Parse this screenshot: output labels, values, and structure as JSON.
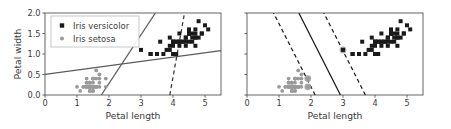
{
  "figure": {
    "background_color": "#ffffff",
    "panels": [
      {
        "id": "left",
        "name": "bad-models-panel",
        "xlabel": "Petal length",
        "ylabel": "Petal width",
        "xticks": [
          "0",
          "1",
          "2",
          "3",
          "4",
          "5"
        ],
        "xtick_values": [
          0,
          1,
          2,
          3,
          4,
          5
        ],
        "yticks": [
          "0.0",
          "0.5",
          "1.0",
          "1.5",
          "2.0"
        ],
        "ytick_values": [
          0.0,
          0.5,
          1.0,
          1.5,
          2.0
        ],
        "show_ytick_labels": true,
        "xlim": [
          0,
          5.5
        ],
        "ylim": [
          0,
          2.0
        ],
        "grid": false,
        "legend": {
          "position": "upper left",
          "entries": [
            {
              "label": "Iris versicolor",
              "marker": "square",
              "color": "#1a1a1a"
            },
            {
              "label": "Iris setosa",
              "marker": "dot",
              "color": "#9a9a9a"
            }
          ]
        },
        "lines": [
          {
            "name": "shallow-solid-boundary",
            "style": "solid",
            "color": "#5a5a5a",
            "p1": [
              0.0,
              0.5
            ],
            "p2": [
              5.5,
              1.08
            ]
          },
          {
            "name": "steep-solid-boundary",
            "style": "solid",
            "color": "#5a5a5a",
            "p1": [
              1.76,
              0.0
            ],
            "p2": [
              3.45,
              2.0
            ]
          },
          {
            "name": "steep-dashed-boundary",
            "style": "dashed",
            "color": "#3a3a3a",
            "p1": [
              3.9,
              0.0
            ],
            "p2": [
              4.36,
              2.0
            ]
          }
        ]
      },
      {
        "id": "right",
        "name": "large-margin-panel",
        "xlabel": "Petal length",
        "ylabel": "",
        "xticks": [
          "0",
          "1",
          "2",
          "3",
          "4",
          "5"
        ],
        "xtick_values": [
          0,
          1,
          2,
          3,
          4,
          5
        ],
        "yticks": [
          "",
          "",
          "",
          "",
          ""
        ],
        "ytick_values": [
          0.0,
          0.5,
          1.0,
          1.5,
          2.0
        ],
        "show_ytick_labels": false,
        "xlim": [
          0,
          5.5
        ],
        "ylim": [
          0,
          2.0
        ],
        "grid": false,
        "legend": null,
        "lines": [
          {
            "name": "svm-decision-boundary",
            "style": "solid",
            "color": "#1a1a1a",
            "p1": [
              2.92,
              0.0
            ],
            "p2": [
              1.62,
              2.0
            ]
          },
          {
            "name": "svm-margin-lower",
            "style": "dashed",
            "color": "#1a1a1a",
            "p1": [
              3.7,
              0.0
            ],
            "p2": [
              2.4,
              2.0
            ]
          },
          {
            "name": "svm-margin-upper",
            "style": "dashed",
            "color": "#1a1a1a",
            "p1": [
              2.13,
              0.0
            ],
            "p2": [
              0.83,
              2.0
            ]
          }
        ],
        "support_vectors": [
          {
            "x": 3.0,
            "y": 1.1,
            "class": "Iris versicolor"
          },
          {
            "x": 1.9,
            "y": 0.4,
            "class": "Iris setosa"
          },
          {
            "x": 1.9,
            "y": 0.2,
            "class": "Iris setosa"
          }
        ]
      }
    ]
  },
  "chart_data": {
    "type": "scatter",
    "title": "",
    "xlabel": "Petal length",
    "ylabel": "Petal width",
    "xlim": [
      0,
      5.5
    ],
    "ylim": [
      0,
      2.0
    ],
    "grid": false,
    "legend_position": "upper left",
    "series": [
      {
        "name": "Iris setosa",
        "marker": "dot",
        "color": "#9a9a9a",
        "points": [
          [
            1.4,
            0.2
          ],
          [
            1.4,
            0.2
          ],
          [
            1.3,
            0.2
          ],
          [
            1.5,
            0.2
          ],
          [
            1.4,
            0.2
          ],
          [
            1.7,
            0.4
          ],
          [
            1.4,
            0.3
          ],
          [
            1.5,
            0.2
          ],
          [
            1.4,
            0.2
          ],
          [
            1.5,
            0.1
          ],
          [
            1.5,
            0.2
          ],
          [
            1.6,
            0.2
          ],
          [
            1.4,
            0.1
          ],
          [
            1.1,
            0.1
          ],
          [
            1.2,
            0.2
          ],
          [
            1.5,
            0.4
          ],
          [
            1.3,
            0.4
          ],
          [
            1.4,
            0.3
          ],
          [
            1.7,
            0.3
          ],
          [
            1.5,
            0.3
          ],
          [
            1.7,
            0.2
          ],
          [
            1.5,
            0.4
          ],
          [
            1.0,
            0.2
          ],
          [
            1.7,
            0.5
          ],
          [
            1.9,
            0.2
          ],
          [
            1.6,
            0.2
          ],
          [
            1.6,
            0.4
          ],
          [
            1.5,
            0.2
          ],
          [
            1.4,
            0.2
          ],
          [
            1.6,
            0.2
          ],
          [
            1.6,
            0.2
          ],
          [
            1.5,
            0.4
          ],
          [
            1.5,
            0.1
          ],
          [
            1.4,
            0.2
          ],
          [
            1.5,
            0.2
          ],
          [
            1.2,
            0.2
          ],
          [
            1.3,
            0.2
          ],
          [
            1.4,
            0.1
          ],
          [
            1.3,
            0.2
          ],
          [
            1.5,
            0.2
          ],
          [
            1.3,
            0.3
          ],
          [
            1.3,
            0.3
          ],
          [
            1.3,
            0.2
          ],
          [
            1.6,
            0.6
          ],
          [
            1.9,
            0.4
          ],
          [
            1.4,
            0.3
          ],
          [
            1.6,
            0.2
          ],
          [
            1.4,
            0.2
          ],
          [
            1.5,
            0.2
          ],
          [
            1.4,
            0.2
          ]
        ]
      },
      {
        "name": "Iris versicolor",
        "marker": "square",
        "color": "#1a1a1a",
        "points": [
          [
            4.7,
            1.4
          ],
          [
            4.5,
            1.5
          ],
          [
            4.9,
            1.5
          ],
          [
            4.0,
            1.3
          ],
          [
            4.6,
            1.5
          ],
          [
            4.5,
            1.3
          ],
          [
            4.7,
            1.6
          ],
          [
            3.3,
            1.0
          ],
          [
            4.6,
            1.3
          ],
          [
            3.9,
            1.4
          ],
          [
            3.5,
            1.0
          ],
          [
            4.2,
            1.5
          ],
          [
            4.0,
            1.0
          ],
          [
            4.7,
            1.4
          ],
          [
            3.6,
            1.3
          ],
          [
            4.4,
            1.4
          ],
          [
            4.5,
            1.5
          ],
          [
            4.1,
            1.0
          ],
          [
            4.5,
            1.5
          ],
          [
            3.9,
            1.1
          ],
          [
            4.8,
            1.8
          ],
          [
            4.0,
            1.3
          ],
          [
            4.9,
            1.5
          ],
          [
            4.7,
            1.2
          ],
          [
            4.3,
            1.3
          ],
          [
            4.4,
            1.4
          ],
          [
            4.8,
            1.4
          ],
          [
            5.0,
            1.7
          ],
          [
            4.5,
            1.5
          ],
          [
            3.5,
            1.0
          ],
          [
            3.8,
            1.1
          ],
          [
            3.7,
            1.0
          ],
          [
            3.9,
            1.2
          ],
          [
            5.1,
            1.6
          ],
          [
            4.5,
            1.5
          ],
          [
            4.5,
            1.6
          ],
          [
            4.7,
            1.5
          ],
          [
            4.4,
            1.3
          ],
          [
            4.1,
            1.3
          ],
          [
            4.0,
            1.3
          ],
          [
            4.4,
            1.2
          ],
          [
            4.6,
            1.4
          ],
          [
            4.0,
            1.2
          ],
          [
            3.3,
            1.0
          ],
          [
            4.2,
            1.3
          ],
          [
            4.2,
            1.2
          ],
          [
            4.2,
            1.3
          ],
          [
            4.3,
            1.3
          ],
          [
            3.0,
            1.1
          ],
          [
            4.1,
            1.3
          ]
        ]
      }
    ]
  }
}
